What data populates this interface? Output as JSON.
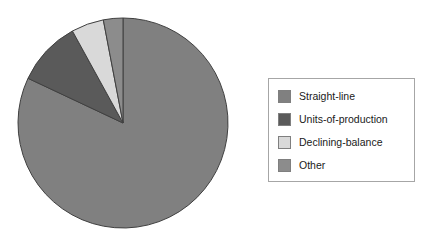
{
  "chart_data": {
    "type": "pie",
    "title": "",
    "subtitle": "",
    "xlabel": "",
    "ylabel": "",
    "grid": false,
    "legend_position": "right",
    "start_angle_deg": 0,
    "direction": "clockwise",
    "categories": [
      "Straight-line",
      "Units-of-production",
      "Declining-balance",
      "Other"
    ],
    "values": [
      82,
      10,
      5,
      3
    ],
    "unit": "%",
    "slices": [
      {
        "label": "Straight-line",
        "value": 82,
        "color": "#808080",
        "start_deg": 0,
        "end_deg": 295.2,
        "swatch_name": "legend-swatch-straight-line"
      },
      {
        "label": "Units-of-production",
        "value": 10,
        "color": "#5a5a5a",
        "start_deg": 295.2,
        "end_deg": 331.2,
        "swatch_name": "legend-swatch-units-of-production"
      },
      {
        "label": "Declining-balance",
        "value": 5,
        "color": "#d9d9d9",
        "start_deg": 331.2,
        "end_deg": 349.2,
        "swatch_name": "legend-swatch-declining-balance"
      },
      {
        "label": "Other",
        "value": 3,
        "color": "#8c8c8c",
        "start_deg": 349.2,
        "end_deg": 360,
        "swatch_name": "legend-swatch-other"
      }
    ],
    "geometry": {
      "center_x": 123,
      "center_y": 123,
      "radius": 105,
      "slice_border_color": "#404040"
    }
  },
  "legend": {
    "border_color": "#a6a6a6",
    "background": "#ffffff",
    "items": [
      {
        "label": "Straight-line",
        "color": "#808080"
      },
      {
        "label": "Units-of-production",
        "color": "#5a5a5a"
      },
      {
        "label": "Declining-balance",
        "color": "#d9d9d9"
      },
      {
        "label": "Other",
        "color": "#8c8c8c"
      }
    ]
  }
}
